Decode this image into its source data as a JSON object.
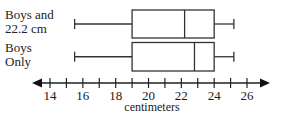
{
  "chart_data": {
    "type": "boxplot",
    "title": "",
    "xlabel": "centimeters",
    "ylabel": "",
    "xlim": [
      13,
      27.2
    ],
    "ticks": [
      14,
      15,
      16,
      17,
      18,
      19,
      20,
      21,
      22,
      23,
      24,
      25,
      26
    ],
    "tick_labels": [
      {
        "value": 14,
        "label": "14"
      },
      {
        "value": 16,
        "label": "16"
      },
      {
        "value": 18,
        "label": "18"
      },
      {
        "value": 20,
        "label": "20"
      },
      {
        "value": 22,
        "label": "22"
      },
      {
        "value": 24,
        "label": "24"
      },
      {
        "value": 26,
        "label": "26"
      }
    ],
    "grid": false,
    "legend": null,
    "series": [
      {
        "name": "Boys and 22.2 cm",
        "label_lines": [
          "Boys and",
          "22.2 cm"
        ],
        "min": 15.5,
        "q1": 19,
        "median": 22.2,
        "q3": 24,
        "max": 25.2
      },
      {
        "name": "Boys Only",
        "label_lines": [
          "Boys",
          "Only"
        ],
        "min": 15.5,
        "q1": 19,
        "median": 22.8,
        "q3": 24,
        "max": 25.2
      }
    ]
  }
}
